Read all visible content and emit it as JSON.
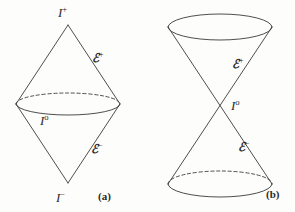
{
  "figure": {
    "background_color": "#fdfdfc",
    "stroke_color": "#3a3a3a",
    "text_color": "#2b2b2b"
  },
  "panels": [
    {
      "id": "a",
      "caption": "(a)",
      "description": "double cone / diamond: two cones joined base to base, upper apex I+, lower apex I-, shared equatorial circle I0",
      "labels": {
        "top_apex": {
          "base": "I",
          "sup": "+"
        },
        "bottom_apex": {
          "base": "I",
          "sup": "−"
        },
        "equator": {
          "base": "I",
          "sup": "o"
        },
        "scri_plus": {
          "base": "ℰ",
          "sup": "+"
        },
        "scri_minus": {
          "base": "ℰ",
          "sup": "−"
        }
      }
    },
    {
      "id": "b",
      "caption": "(b)",
      "description": "hourglass: upper cone opening upward and lower cone opening downward meeting at point I0",
      "labels": {
        "waist": {
          "base": "I",
          "sup": "o"
        },
        "scri_plus": {
          "base": "ℰ",
          "sup": "+"
        },
        "scri_minus": {
          "base": "ℰ",
          "sup": "−"
        }
      }
    }
  ],
  "geometry": {
    "panel_a": {
      "top_apex": [
        68,
        25
      ],
      "bottom_apex": [
        68,
        183
      ],
      "ellipse_center": [
        68,
        104
      ],
      "ellipse_rx": 52,
      "ellipse_ry": 11
    },
    "panel_b": {
      "top_ellipse_center": [
        220,
        27
      ],
      "top_ellipse_rx": 52,
      "top_ellipse_ry": 13,
      "bottom_ellipse_center": [
        220,
        184
      ],
      "bottom_ellipse_rx": 52,
      "bottom_ellipse_ry": 13,
      "waist": [
        220,
        104
      ]
    }
  }
}
